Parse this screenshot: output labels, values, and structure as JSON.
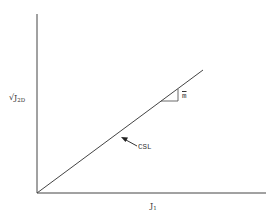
{
  "diagram": {
    "type": "stress-path / critical state line",
    "y_axis": {
      "label_main": "√J",
      "label_sub": "2D"
    },
    "x_axis": {
      "label_main": "J",
      "label_sub": "1"
    },
    "line": {
      "label": "CSL",
      "from": [
        0,
        0
      ],
      "direction": "linear through origin"
    },
    "slope": {
      "label": "m"
    },
    "colors": {
      "stroke": "#444444",
      "background": "#ffffff"
    }
  }
}
